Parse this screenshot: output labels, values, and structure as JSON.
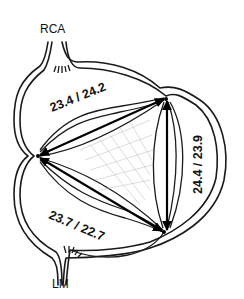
{
  "diagram": {
    "type": "aortic-root-commissure-distances",
    "ostia": {
      "rca": {
        "label": "RCA"
      },
      "lm": {
        "label": "LM"
      }
    },
    "measurements": [
      {
        "id": "left-to-top-right",
        "label": "23.4 / 24.2",
        "from": "left-commissure",
        "to": "top-right-commissure"
      },
      {
        "id": "top-right-to-bottom-right",
        "label": "24.4 / 23.9",
        "from": "top-right-commissure",
        "to": "bottom-right-commissure"
      },
      {
        "id": "left-to-bottom-right",
        "label": "23.7 / 22.7",
        "from": "left-commissure",
        "to": "bottom-right-commissure"
      }
    ],
    "commissures": [
      {
        "id": "left-commissure",
        "x": 38,
        "y": 156
      },
      {
        "id": "top-right-commissure",
        "x": 166,
        "y": 99
      },
      {
        "id": "bottom-right-commissure",
        "x": 164,
        "y": 232
      }
    ],
    "colors": {
      "stroke": "#1a1a1a",
      "hatch": "#b8b8b8",
      "background": "#ffffff"
    }
  }
}
